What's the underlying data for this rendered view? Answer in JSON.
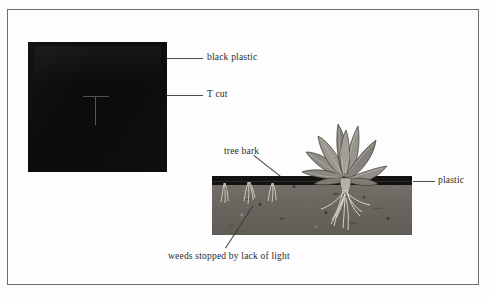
{
  "figure": {
    "background_color": "#fdfdfd",
    "frame_color": "#6e6e6e",
    "illustration_type": "black-plastic-mulch-garden-cross-section-diagram"
  },
  "panels": {
    "left": {
      "name": "black plastic sheet with T cut",
      "sheet_color": "#0d0b0b",
      "cut_color": "#585452"
    },
    "right": {
      "name": "soil cross section with mulched plant",
      "soil_color": "#6d6a63",
      "mulch_color": "#141211",
      "leaf_color": "#8e8b84",
      "root_color": "#e8e5dd"
    }
  },
  "labels": {
    "black_plastic": "black plastic",
    "t_cut": "T cut",
    "tree_bark": "tree bark",
    "plastic": "plastic",
    "weeds_stopped": "weeds stopped by lack of light"
  },
  "colors": {
    "text": "#2b2b2b",
    "leader_line": "#4c4c4c",
    "page_background": "#ffffff"
  }
}
